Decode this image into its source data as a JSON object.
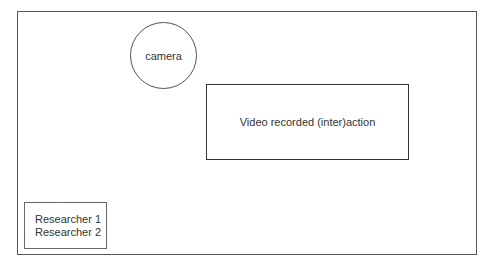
{
  "diagram": {
    "camera": {
      "label": "camera",
      "shape": "circle"
    },
    "video": {
      "label": "Video recorded (inter)action",
      "shape": "rectangle"
    },
    "researchers": {
      "lines": [
        "Researcher 1",
        "Researcher 2"
      ],
      "shape": "rectangle"
    }
  }
}
